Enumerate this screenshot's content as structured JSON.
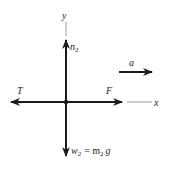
{
  "diagram": {
    "type": "free-body-diagram",
    "axes": {
      "x_label": "x",
      "y_label": "y"
    },
    "forces": [
      {
        "name": "normal",
        "label": "n",
        "subscript": "2",
        "direction": "up"
      },
      {
        "name": "tension",
        "label": "T",
        "direction": "left"
      },
      {
        "name": "applied",
        "label": "F",
        "direction": "right"
      },
      {
        "name": "weight",
        "label": "w",
        "subscript": "2",
        "equation": "= m",
        "eq_subscript": "2",
        "eq_tail": "g",
        "direction": "down"
      }
    ],
    "acceleration": {
      "label": "a",
      "direction": "right"
    },
    "colors": {
      "arrow": "#1a1a1a",
      "axis": "#9a9a9a",
      "text": "#222222"
    }
  }
}
